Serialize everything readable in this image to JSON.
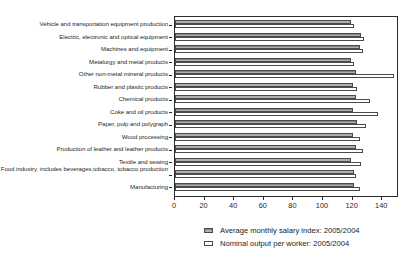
{
  "chart_data": {
    "type": "bar",
    "orientation": "horizontal",
    "title": "",
    "xlabel": "",
    "ylabel": "",
    "xlim": [
      0,
      150
    ],
    "xticks": [
      0,
      20,
      40,
      60,
      80,
      100,
      120,
      140
    ],
    "xtick_labels": [
      "0",
      "20",
      "40",
      "60",
      "80",
      "100",
      "120",
      "140"
    ],
    "grid": false,
    "legend_position": "bottom-right",
    "categories": [
      "Vehicle and transportation equipment production",
      "Electric, electronic and optical equipment",
      "Machines and equipment",
      "Metalurgy and metal products",
      "Other non-metal mineral products",
      "Rubber and plastic products",
      "Chemical products",
      "Coke and oil products",
      "Paper, pulp and polygraph",
      "Wood processing",
      "Production of leather and leather products",
      "Textile and sewing",
      "Food industry, includes beverages,tobacco, tobacco production",
      "Manufacturing"
    ],
    "series": [
      {
        "name": "Average monthly salary index: 2005/2004",
        "color": "#8c8c8c",
        "values": [
          119,
          126,
          125,
          119,
          122,
          120,
          122,
          120,
          123,
          120,
          122,
          119,
          121,
          121
        ]
      },
      {
        "name": "Nominal output per worker: 2005/2004",
        "color": "#ffffff",
        "values": [
          121,
          128,
          127,
          121,
          148,
          123,
          132,
          137,
          129,
          125,
          127,
          126,
          122,
          125
        ]
      }
    ]
  },
  "legend": {
    "items": [
      {
        "label": "Average monthly salary index: 2005/2004",
        "swatch": "salary"
      },
      {
        "label": "Nominal output per worker: 2005/2004",
        "swatch": "output"
      }
    ]
  }
}
